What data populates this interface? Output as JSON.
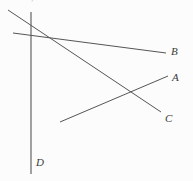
{
  "figure": {
    "background_color": "#fcfcfc",
    "stroke_color": "#555555",
    "label_color": "#3a3a3a",
    "width": 193,
    "height": 181,
    "clipped_caption_text": "11. 21, 1 1 1 1 1 1  1 1  1   1 1 1 1 1",
    "labels": [
      {
        "name": "label-b",
        "text": "B",
        "x": 171,
        "y": 46
      },
      {
        "name": "label-a",
        "text": "A",
        "x": 172,
        "y": 72
      },
      {
        "name": "label-c",
        "text": "C",
        "x": 165,
        "y": 113
      },
      {
        "name": "label-d",
        "text": "D",
        "x": 36,
        "y": 157
      }
    ],
    "lines": [
      {
        "name": "vertical-axis-d",
        "label": "D",
        "x1": 31,
        "y1": 12,
        "x2": 31,
        "y2": 174,
        "stroke_width": 1.1
      },
      {
        "name": "line-segment-b",
        "label": "B",
        "x1": 13,
        "y1": 33,
        "x2": 166,
        "y2": 53,
        "stroke_width": 1.0
      },
      {
        "name": "line-segment-c",
        "label": "C",
        "x1": 8,
        "y1": 10,
        "x2": 161,
        "y2": 112,
        "stroke_width": 1.0
      },
      {
        "name": "line-segment-a",
        "label": "A",
        "x1": 60,
        "y1": 122,
        "x2": 168,
        "y2": 76,
        "stroke_width": 1.0
      }
    ],
    "intersections": [
      {
        "name": "intersection-bc",
        "x": 51,
        "y": 38
      },
      {
        "name": "intersection-ac",
        "x": 135,
        "y": 100
      },
      {
        "name": "intersection-cd",
        "x": 31,
        "y": 26
      },
      {
        "name": "intersection-bd",
        "x": 31,
        "y": 35
      }
    ]
  }
}
